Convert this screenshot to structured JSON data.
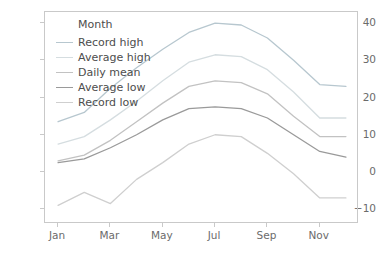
{
  "chart_data": {
    "type": "line",
    "title": "",
    "xlabel": "",
    "ylabel": "",
    "grid": false,
    "legend_position": "upper left",
    "legend_title": "Month",
    "x": [
      "Jan",
      "Feb",
      "Mar",
      "Apr",
      "May",
      "Jun",
      "Jul",
      "Aug",
      "Sep",
      "Oct",
      "Nov",
      "Dec"
    ],
    "xticks": [
      "Jan",
      "Mar",
      "May",
      "Jul",
      "Sep",
      "Nov"
    ],
    "xtick_values": [
      1,
      3,
      5,
      7,
      9,
      11
    ],
    "yticks": [
      -10,
      0,
      10,
      20,
      30,
      40
    ],
    "ylim": [
      -14,
      43
    ],
    "xlim": [
      0.5,
      12.5
    ],
    "series": [
      {
        "name": "Record high",
        "color": "#b7c7cf",
        "values": [
          13.5,
          16.0,
          22.5,
          28.0,
          33.0,
          37.5,
          40.0,
          39.5,
          36.0,
          30.0,
          23.5,
          23.0
        ]
      },
      {
        "name": "Average high",
        "color": "#d5dde0",
        "values": [
          7.5,
          9.5,
          14.0,
          19.0,
          24.5,
          29.5,
          31.5,
          31.0,
          27.5,
          21.5,
          14.5,
          14.5
        ]
      },
      {
        "name": "Daily mean",
        "color": "#c2c2c2",
        "values": [
          3.0,
          4.5,
          8.5,
          13.5,
          18.5,
          23.0,
          24.5,
          24.0,
          21.0,
          15.0,
          9.5,
          9.5
        ]
      },
      {
        "name": "Average low",
        "color": "#9a9a9a",
        "values": [
          2.5,
          3.5,
          6.5,
          10.0,
          14.0,
          17.0,
          17.5,
          17.0,
          14.5,
          10.0,
          5.5,
          4.0
        ]
      },
      {
        "name": "Record low",
        "color": "#cfcfcf",
        "values": [
          -9.0,
          -5.5,
          -8.5,
          -2.0,
          2.5,
          7.5,
          10.0,
          9.5,
          5.0,
          -0.5,
          -7.0,
          -7.0
        ]
      }
    ]
  },
  "axis": {
    "tick_color": "#6b6b6b",
    "frame_color": "#c9c9c9"
  }
}
